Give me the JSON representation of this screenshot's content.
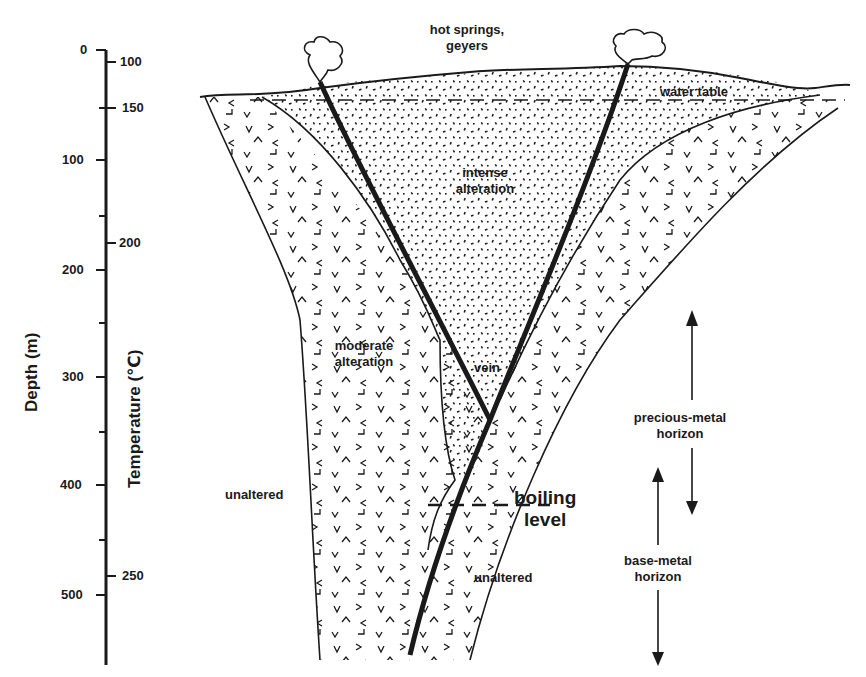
{
  "figure": {
    "type": "geologic cross-section"
  },
  "axes": {
    "depth": {
      "title": "Depth (m)",
      "ticks": [
        {
          "label": "0",
          "y": 50
        },
        {
          "label": "100",
          "y": 160
        },
        {
          "label": "200",
          "y": 270
        },
        {
          "label": "300",
          "y": 377
        },
        {
          "label": "400",
          "y": 485
        },
        {
          "label": "500",
          "y": 595
        }
      ]
    },
    "temperature": {
      "title": "Temperature (℃)",
      "ticks": [
        {
          "label": "100",
          "y": 62
        },
        {
          "label": "150",
          "y": 108
        },
        {
          "label": "200",
          "y": 243
        },
        {
          "label": "250",
          "y": 576
        }
      ]
    }
  },
  "labels": {
    "hot_springs_line1": "hot springs,",
    "hot_springs_line2": "geyers",
    "water_table": "water table",
    "intense_line1": "intense",
    "intense_line2": "alteration",
    "moderate_line1": "moderate",
    "moderate_line2": "alteration",
    "vein": "vein",
    "unaltered_left": "unaltered",
    "unaltered_right": "unaltered",
    "boiling_line1": "boiling",
    "boiling_line2": "level",
    "precious_line1": "precious-metal",
    "precious_line2": "horizon",
    "base_line1": "base-metal",
    "base_line2": "horizon"
  },
  "colors": {
    "ink": "#1a1a1a",
    "paper": "#ffffff"
  }
}
